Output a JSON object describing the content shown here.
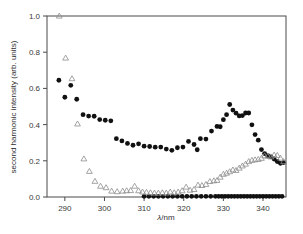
{
  "chart_data": {
    "type": "scatter",
    "title": "",
    "xlabel": "λ/nm",
    "ylabel": "second harmonic intensity (arb. units)",
    "xlim": [
      285.5,
      345.8
    ],
    "ylim": [
      0.0,
      1.0
    ],
    "xticks": [
      290,
      300,
      310,
      320,
      330,
      340
    ],
    "xticklabels": [
      "290",
      "300",
      "310",
      "320",
      "330",
      "340"
    ],
    "yticks": [
      0.0,
      0.2,
      0.4,
      0.6,
      0.8,
      1.0
    ],
    "yticklabels": [
      "0.0",
      "0.2",
      "0.4",
      "0.6",
      "0.8",
      "1.0"
    ],
    "grid": false,
    "legend": "none",
    "frame": "box",
    "series": [
      {
        "name": "filled-circles",
        "marker": "circle",
        "color": "#111111",
        "filled": true,
        "x": [
          288.5,
          290.0,
          291.5,
          293.0,
          294.6,
          296.0,
          297.4,
          298.8,
          300.2,
          301.6,
          303.0,
          304.4,
          305.8,
          307.2,
          308.6,
          310.0,
          311.4,
          312.8,
          314.2,
          315.6,
          317.0,
          318.4,
          319.8,
          321.2,
          322.6,
          323.4,
          324.2,
          325.6,
          327.0,
          328.4,
          329.2,
          330.0,
          330.8,
          331.6,
          332.4,
          333.2,
          334.0,
          334.8,
          335.6,
          336.4,
          337.2,
          338.0,
          338.8,
          339.6,
          340.4,
          341.2,
          342.0,
          342.8,
          343.6,
          344.4,
          345.2
        ],
        "y": [
          0.645,
          0.551,
          0.617,
          0.54,
          0.455,
          0.447,
          0.446,
          0.428,
          0.424,
          0.421,
          0.322,
          0.31,
          0.296,
          0.286,
          0.294,
          0.281,
          0.279,
          0.275,
          0.276,
          0.265,
          0.258,
          0.272,
          0.276,
          0.307,
          0.29,
          0.261,
          0.322,
          0.32,
          0.364,
          0.39,
          0.388,
          0.427,
          0.455,
          0.511,
          0.48,
          0.463,
          0.448,
          0.45,
          0.464,
          0.464,
          0.399,
          0.345,
          0.314,
          0.262,
          0.24,
          0.228,
          0.222,
          0.21,
          0.196,
          0.186,
          0.19
        ]
      },
      {
        "name": "filled-circles-baseline",
        "marker": "circle",
        "color": "#111111",
        "filled": true,
        "x": [
          310.0,
          311.2,
          312.4,
          313.6,
          314.8,
          316.0,
          317.2,
          318.4,
          319.6,
          320.8,
          322.0,
          323.2,
          324.4,
          325.6,
          326.8,
          328.0,
          328.8,
          329.6,
          330.4,
          331.2,
          332.0,
          332.8,
          333.6,
          334.4,
          335.2,
          336.0,
          336.8,
          337.6,
          338.4,
          339.2,
          340.0,
          340.8,
          341.6,
          342.4,
          343.2,
          344.0,
          344.8
        ],
        "y": [
          0.004,
          0.004,
          0.004,
          0.004,
          0.004,
          0.004,
          0.004,
          0.004,
          0.004,
          0.004,
          0.004,
          0.004,
          0.004,
          0.004,
          0.004,
          0.004,
          0.004,
          0.004,
          0.004,
          0.004,
          0.004,
          0.004,
          0.004,
          0.004,
          0.004,
          0.004,
          0.004,
          0.004,
          0.004,
          0.004,
          0.004,
          0.004,
          0.004,
          0.004,
          0.004,
          0.004,
          0.004
        ]
      },
      {
        "name": "open-triangles",
        "marker": "triangle-up",
        "color": "#8d8d8d",
        "filled": false,
        "x": [
          288.6,
          290.2,
          291.8,
          293.2,
          294.8,
          296.2,
          297.6,
          299.0,
          300.4,
          301.8,
          303.2,
          304.6,
          305.6,
          306.6,
          307.6,
          308.6,
          309.6,
          310.6,
          311.6,
          312.6,
          313.6,
          314.6,
          315.6,
          316.6,
          317.6,
          318.6,
          319.6,
          320.6,
          321.6,
          322.6,
          323.6,
          324.6,
          325.6,
          326.6,
          327.6,
          328.4,
          329.2,
          330.0,
          330.8,
          331.6,
          332.4,
          333.2,
          334.0,
          334.8,
          335.6,
          336.4,
          337.2,
          338.0,
          338.8,
          339.6,
          340.4,
          341.2,
          342.0,
          342.8,
          343.6,
          344.4,
          345.2
        ],
        "y": [
          1.0,
          0.768,
          0.654,
          0.404,
          0.211,
          0.142,
          0.087,
          0.06,
          0.052,
          0.033,
          0.03,
          0.033,
          0.035,
          0.036,
          0.06,
          0.035,
          0.028,
          0.026,
          0.024,
          0.022,
          0.022,
          0.024,
          0.022,
          0.028,
          0.024,
          0.028,
          0.035,
          0.055,
          0.038,
          0.042,
          0.066,
          0.064,
          0.07,
          0.086,
          0.09,
          0.092,
          0.11,
          0.126,
          0.132,
          0.14,
          0.15,
          0.147,
          0.16,
          0.172,
          0.182,
          0.196,
          0.203,
          0.206,
          0.208,
          0.214,
          0.228,
          0.226,
          0.222,
          0.232,
          0.23,
          0.215,
          0.196
        ]
      }
    ]
  }
}
